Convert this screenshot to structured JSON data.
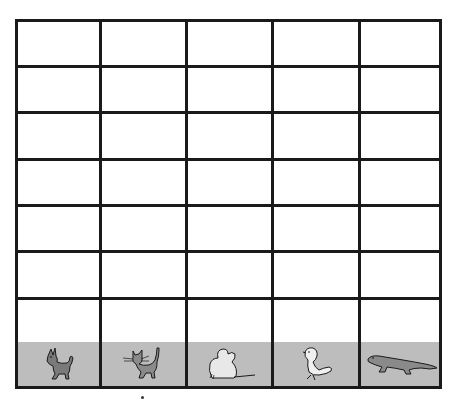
{
  "grid": {
    "columns": 5,
    "empty_rows": 7,
    "line_color": "#1a1a1a",
    "animal_row_bg": "#bdbdbd"
  },
  "animals": [
    {
      "name": "dog",
      "icon": "dog-icon",
      "fill": "#7a7a7a"
    },
    {
      "name": "cat",
      "icon": "cat-icon",
      "fill": "#8a8a8a"
    },
    {
      "name": "mouse",
      "icon": "mouse-icon",
      "fill": "#e8e8e8"
    },
    {
      "name": "bird",
      "icon": "bird-icon",
      "fill": "#f0f0f0"
    },
    {
      "name": "lizard",
      "icon": "lizard-icon",
      "fill": "#8a8a8a"
    }
  ]
}
